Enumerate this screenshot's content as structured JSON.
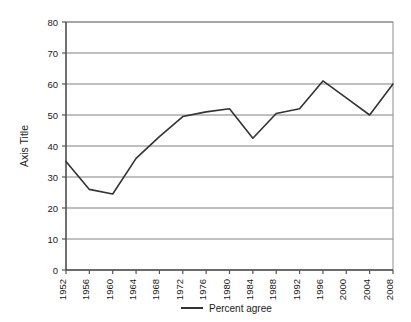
{
  "chart_data": {
    "type": "line",
    "title": "",
    "xlabel": "",
    "ylabel": "Axis Title",
    "ylim": [
      0,
      80
    ],
    "ytick_step": 10,
    "yticks": [
      "0",
      "10",
      "20",
      "30",
      "40",
      "50",
      "60",
      "70",
      "80"
    ],
    "categories": [
      "1952",
      "1956",
      "1960",
      "1964",
      "1968",
      "1972",
      "1976",
      "1980",
      "1984",
      "1988",
      "1992",
      "1996",
      "2000",
      "2004",
      "2008"
    ],
    "series": [
      {
        "name": "Percent agree",
        "color": "#333333",
        "values": [
          35,
          26,
          24.5,
          36,
          43,
          49.5,
          51,
          52,
          42.5,
          50.5,
          52,
          61,
          55.5,
          50,
          60
        ]
      }
    ],
    "grid": {
      "horizontal": true,
      "vertical": false,
      "color": "#808080"
    },
    "legend": {
      "position": "bottom",
      "entries": [
        "Percent agree"
      ]
    },
    "plot_border_color": "#808080",
    "axis_color": "#555555",
    "background": "#ffffff"
  },
  "legend": {
    "label": "Percent agree"
  },
  "axis": {
    "y_title": "Axis Title"
  }
}
